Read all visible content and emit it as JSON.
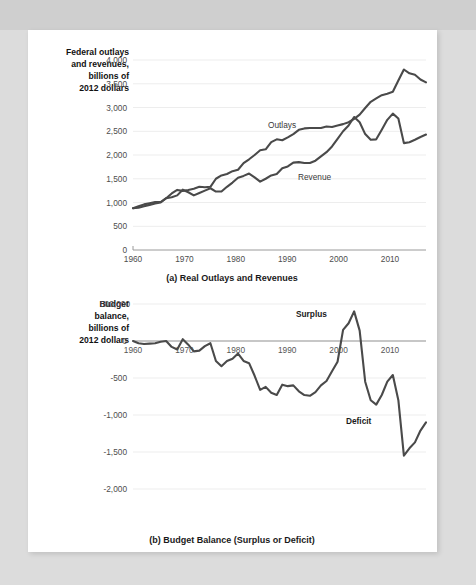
{
  "figure": {
    "panel_a": {
      "caption": "(a) Real Outlays and Revenues",
      "side_title_lines": [
        "Federal outlays",
        "and revenues,",
        "billions of",
        "2012 dollars"
      ],
      "y_ticks": [
        "0",
        "500",
        "1,000",
        "1,500",
        "2,000",
        "2,500",
        "3,000",
        "3,500",
        "4,000"
      ],
      "x_ticks": [
        "1960",
        "1970",
        "1980",
        "1990",
        "2000",
        "2010"
      ],
      "annotations": [
        "Outlays",
        "Revenue"
      ]
    },
    "panel_b": {
      "caption": "(b) Budget Balance (Surplus or Deficit)",
      "side_title_lines": [
        "Budget",
        "balance,",
        "billions of",
        "2012 dollars"
      ],
      "y_ticks": [
        "500,000",
        "0",
        "-500",
        "-1,000",
        "-1,500",
        "-2,000"
      ],
      "x_ticks": [
        "1960",
        "1970",
        "1980",
        "1990",
        "2000",
        "2010"
      ],
      "annotations": [
        "Surplus",
        "Deficit"
      ]
    },
    "colors": {
      "line": "#4a4a4a",
      "grid": "#ededed",
      "axis": "#9a9a9a",
      "text": "#4d4d4d",
      "sheet": "#ffffff",
      "backdrop": "#dcdcdc"
    }
  },
  "chart_data": [
    {
      "type": "line",
      "title": "(a) Real Outlays and Revenues",
      "xlabel": "",
      "ylabel": "Federal outlays and revenues, billions of 2012 dollars",
      "xlim": [
        1960,
        2013
      ],
      "ylim": [
        0,
        4000
      ],
      "ytick_values": [
        0,
        500,
        1000,
        1500,
        2000,
        2500,
        3000,
        3500,
        4000
      ],
      "xtick_values": [
        1960,
        1970,
        1980,
        1990,
        2000,
        2010
      ],
      "grid": true,
      "legend": "inline-annotations",
      "x": [
        1960,
        1961,
        1962,
        1963,
        1964,
        1965,
        1966,
        1967,
        1968,
        1969,
        1970,
        1971,
        1972,
        1973,
        1974,
        1975,
        1976,
        1977,
        1978,
        1979,
        1980,
        1981,
        1982,
        1983,
        1984,
        1985,
        1986,
        1987,
        1988,
        1989,
        1990,
        1991,
        1992,
        1993,
        1994,
        1995,
        1996,
        1997,
        1998,
        1999,
        2000,
        2001,
        2002,
        2003,
        2004,
        2005,
        2006,
        2007,
        2008,
        2009,
        2010,
        2011,
        2012,
        2013
      ],
      "series": [
        {
          "name": "Outlays",
          "values": [
            880,
            920,
            960,
            985,
            1010,
            1010,
            1090,
            1190,
            1265,
            1245,
            1265,
            1290,
            1330,
            1320,
            1330,
            1500,
            1570,
            1600,
            1660,
            1690,
            1830,
            1910,
            2000,
            2100,
            2120,
            2270,
            2330,
            2310,
            2370,
            2440,
            2530,
            2560,
            2570,
            2570,
            2570,
            2600,
            2590,
            2620,
            2650,
            2690,
            2760,
            2850,
            2990,
            3120,
            3190,
            3260,
            3290,
            3330,
            3570,
            3800,
            3720,
            3690,
            3590,
            3530
          ]
        },
        {
          "name": "Revenue",
          "values": [
            880,
            890,
            920,
            950,
            980,
            1000,
            1090,
            1110,
            1150,
            1270,
            1215,
            1150,
            1200,
            1250,
            1300,
            1230,
            1230,
            1330,
            1420,
            1520,
            1560,
            1610,
            1530,
            1440,
            1500,
            1570,
            1600,
            1720,
            1760,
            1840,
            1850,
            1830,
            1830,
            1880,
            1970,
            2060,
            2180,
            2340,
            2500,
            2620,
            2800,
            2690,
            2440,
            2320,
            2330,
            2530,
            2740,
            2870,
            2770,
            2250,
            2270,
            2320,
            2380,
            2430
          ]
        }
      ],
      "annotations": [
        {
          "text": "Outlays",
          "x": 1985,
          "y": 2550
        },
        {
          "text": "Revenue",
          "x": 1991,
          "y": 1470
        }
      ]
    },
    {
      "type": "line",
      "title": "(b) Budget Balance (Surplus or Deficit)",
      "xlabel": "",
      "ylabel": "Budget balance, billions of 2012 dollars",
      "xlim": [
        1960,
        2013
      ],
      "ylim": [
        -2000,
        500
      ],
      "ytick_values": [
        500,
        0,
        -500,
        -1000,
        -1500,
        -2000
      ],
      "ytick_labels": [
        "500,000",
        "0",
        "-500",
        "-1,000",
        "-1,500",
        "-2,000"
      ],
      "xtick_values": [
        1960,
        1970,
        1980,
        1990,
        2000,
        2010
      ],
      "grid": true,
      "legend": "inline-annotations",
      "x": [
        1960,
        1961,
        1962,
        1963,
        1964,
        1965,
        1966,
        1967,
        1968,
        1969,
        1970,
        1971,
        1972,
        1973,
        1974,
        1975,
        1976,
        1977,
        1978,
        1979,
        1980,
        1981,
        1982,
        1983,
        1984,
        1985,
        1986,
        1987,
        1988,
        1989,
        1990,
        1991,
        1992,
        1993,
        1994,
        1995,
        1996,
        1997,
        1998,
        1999,
        2000,
        2001,
        2002,
        2003,
        2004,
        2005,
        2006,
        2007,
        2008,
        2009,
        2010,
        2011,
        2012,
        2013
      ],
      "series": [
        {
          "name": "Budget balance",
          "values": [
            0,
            -30,
            -40,
            -35,
            -30,
            -10,
            0,
            -80,
            -115,
            25,
            -50,
            -140,
            -130,
            -70,
            -30,
            -270,
            -340,
            -270,
            -240,
            -170,
            -270,
            -300,
            -470,
            -660,
            -620,
            -700,
            -730,
            -590,
            -610,
            -600,
            -680,
            -730,
            -740,
            -690,
            -600,
            -540,
            -410,
            -280,
            150,
            240,
            400,
            140,
            -550,
            -800,
            -860,
            -730,
            -550,
            -460,
            -800,
            -1550,
            -1450,
            -1370,
            -1210,
            -1100
          ]
        }
      ],
      "annotations": [
        {
          "text": "Surplus",
          "x": 1995,
          "y": 330
        },
        {
          "text": "Deficit",
          "x": 2006,
          "y": -1080
        }
      ]
    }
  ]
}
